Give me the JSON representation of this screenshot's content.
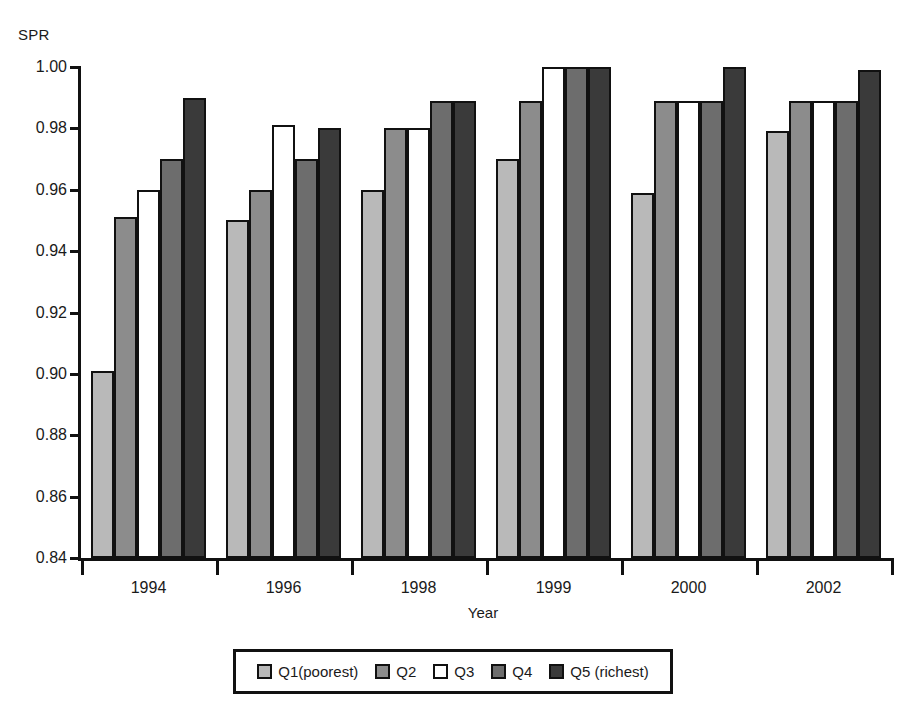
{
  "chart_data": {
    "type": "bar",
    "title": "",
    "subtitle": "",
    "xlabel": "Year",
    "ylabel": "SPR",
    "ylim": [
      0.84,
      1.0
    ],
    "yticks": [
      "1.00",
      "0.98",
      "0.96",
      "0.94",
      "0.92",
      "0.90",
      "0.88",
      "0.86",
      "0.84"
    ],
    "ytick_values": [
      1.0,
      0.98,
      0.96,
      0.94,
      0.92,
      0.9,
      0.88,
      0.86,
      0.84
    ],
    "grid": false,
    "legend_position": "bottom",
    "categories": [
      "1994",
      "1996",
      "1998",
      "1999",
      "2000",
      "2002"
    ],
    "series": [
      {
        "name": "Q1(poorest)",
        "color": "#b9b9b9",
        "values": [
          0.901,
          0.95,
          0.96,
          0.97,
          0.959,
          0.979
        ]
      },
      {
        "name": "Q2",
        "color": "#8c8c8c",
        "values": [
          0.951,
          0.96,
          0.98,
          0.989,
          0.989,
          0.989
        ]
      },
      {
        "name": "Q3",
        "color": "#ffffff",
        "values": [
          0.96,
          0.981,
          0.98,
          1.0,
          0.989,
          0.989
        ]
      },
      {
        "name": "Q4",
        "color": "#6d6d6d",
        "values": [
          0.97,
          0.97,
          0.989,
          1.0,
          0.989,
          0.989
        ]
      },
      {
        "name": "Q5 (richest)",
        "color": "#3a3a3a",
        "values": [
          0.99,
          0.98,
          0.989,
          1.0,
          1.0,
          0.999
        ]
      }
    ]
  },
  "legend": {
    "items": [
      {
        "label": "Q1(poorest)"
      },
      {
        "label": "Q2"
      },
      {
        "label": "Q3"
      },
      {
        "label": "Q4"
      },
      {
        "label": "Q5 (richest)"
      }
    ]
  }
}
